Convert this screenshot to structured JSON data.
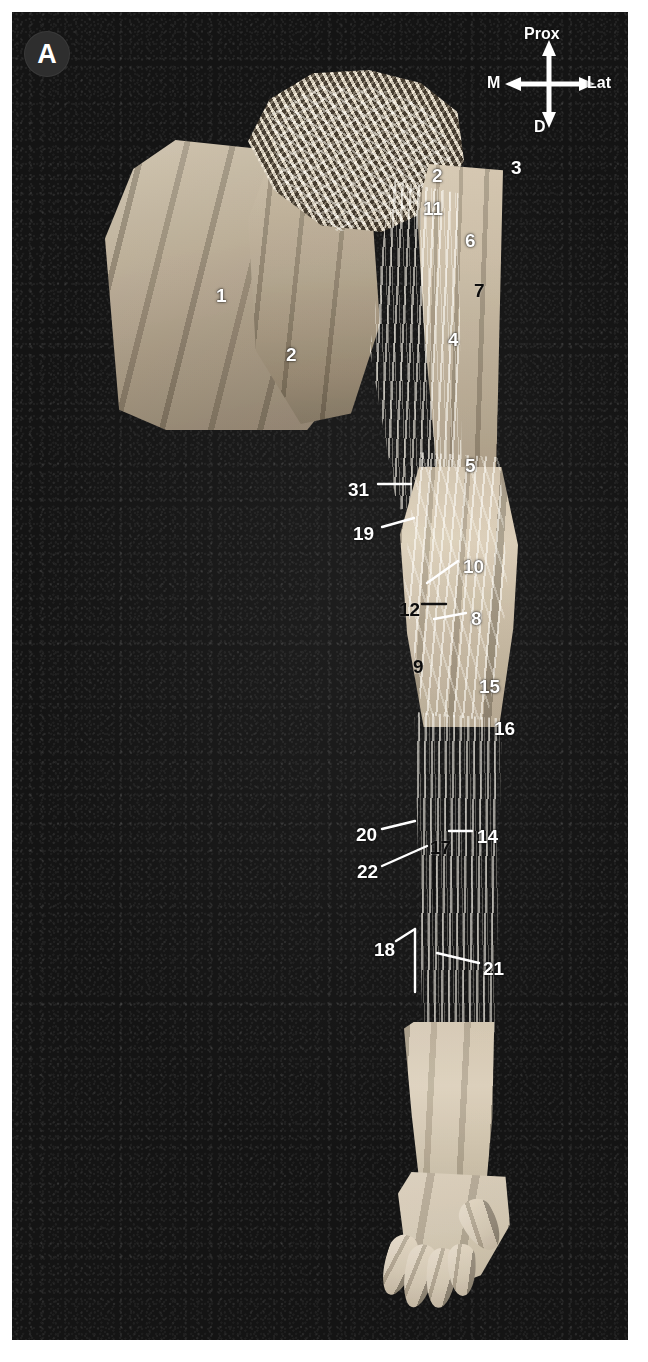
{
  "plate": {
    "panel_letter": "A",
    "background_color": "#141414",
    "label_light_color": "#ffffff",
    "label_dark_color": "#0c0c0c",
    "panel_badge_color": "#2e2e2e"
  },
  "compass": {
    "name": "orientation-compass",
    "proximal": "Prox",
    "medial": "M",
    "lateral": "Lat",
    "distal": "D"
  },
  "callouts": [
    {
      "id": "1",
      "text": "1",
      "x": 216,
      "y": 286,
      "color": "light",
      "region": "pectoralis-major"
    },
    {
      "id": "2a",
      "text": "2",
      "x": 286,
      "y": 345,
      "color": "light",
      "region": "deltoid-inferior"
    },
    {
      "id": "2b",
      "text": "2",
      "x": 432,
      "y": 166,
      "color": "light",
      "region": "deltoid-superior"
    },
    {
      "id": "3",
      "text": "3",
      "x": 511,
      "y": 158,
      "color": "light",
      "region": "lateral-shoulder"
    },
    {
      "id": "11",
      "text": "11",
      "x": 423,
      "y": 199,
      "color": "light",
      "region": "axillary-structure"
    },
    {
      "id": "6",
      "text": "6",
      "x": 465,
      "y": 231,
      "color": "light",
      "region": "upper-arm-medial"
    },
    {
      "id": "7",
      "text": "7",
      "x": 474,
      "y": 281,
      "color": "dark",
      "region": "upper-arm-lateral"
    },
    {
      "id": "4",
      "text": "4",
      "x": 448,
      "y": 330,
      "color": "light",
      "region": "mid-arm-nerve"
    },
    {
      "id": "5",
      "text": "5",
      "x": 465,
      "y": 456,
      "color": "light",
      "region": "distal-arm-muscle"
    },
    {
      "id": "31",
      "text": "31",
      "x": 348,
      "y": 480,
      "color": "light",
      "region": "medial-cutaneous-branch"
    },
    {
      "id": "19",
      "text": "19",
      "x": 353,
      "y": 524,
      "color": "light",
      "region": "medial-forearm-nerve"
    },
    {
      "id": "10",
      "text": "10",
      "x": 463,
      "y": 557,
      "color": "light",
      "region": "cubital-vessel"
    },
    {
      "id": "12",
      "text": "12",
      "x": 399,
      "y": 600,
      "color": "dark",
      "region": "cubital-fossa-medial"
    },
    {
      "id": "8",
      "text": "8",
      "x": 471,
      "y": 609,
      "color": "light",
      "region": "cubital-fossa-lateral"
    },
    {
      "id": "9",
      "text": "9",
      "x": 413,
      "y": 657,
      "color": "dark",
      "region": "forearm-flexor-mass"
    },
    {
      "id": "15",
      "text": "15",
      "x": 479,
      "y": 677,
      "color": "light",
      "region": "lateral-forearm-proximal"
    },
    {
      "id": "16",
      "text": "16",
      "x": 494,
      "y": 719,
      "color": "light",
      "region": "lateral-forearm"
    },
    {
      "id": "20",
      "text": "20",
      "x": 356,
      "y": 825,
      "color": "light",
      "region": "medial-forearm-branch"
    },
    {
      "id": "17",
      "text": "17",
      "x": 430,
      "y": 838,
      "color": "dark",
      "region": "mid-forearm-tendon"
    },
    {
      "id": "14",
      "text": "14",
      "x": 477,
      "y": 827,
      "color": "light",
      "region": "radial-side-structure"
    },
    {
      "id": "22",
      "text": "22",
      "x": 357,
      "y": 862,
      "color": "light",
      "region": "ulnar-side-branch"
    },
    {
      "id": "18",
      "text": "18",
      "x": 374,
      "y": 940,
      "color": "light",
      "region": "distal-ulnar-structure"
    },
    {
      "id": "21",
      "text": "21",
      "x": 483,
      "y": 959,
      "color": "light",
      "region": "distal-radial-structure"
    }
  ],
  "leaders": [
    {
      "id": "leader-31",
      "x1": 378,
      "y1": 484,
      "x2": 411,
      "y2": 484,
      "stroke": "#ffffff"
    },
    {
      "id": "leader-19",
      "x1": 382,
      "y1": 527,
      "x2": 414,
      "y2": 518,
      "stroke": "#ffffff"
    },
    {
      "id": "leader-10",
      "x1": 458,
      "y1": 561,
      "x2": 427,
      "y2": 583,
      "stroke": "#ffffff"
    },
    {
      "id": "leader-12",
      "x1": 422,
      "y1": 604,
      "x2": 446,
      "y2": 604,
      "stroke": "#111111"
    },
    {
      "id": "leader-8",
      "x1": 466,
      "y1": 613,
      "x2": 434,
      "y2": 619,
      "stroke": "#ffffff"
    },
    {
      "id": "leader-20",
      "x1": 382,
      "y1": 829,
      "x2": 415,
      "y2": 821,
      "stroke": "#ffffff"
    },
    {
      "id": "leader-22",
      "x1": 382,
      "y1": 866,
      "x2": 427,
      "y2": 846,
      "stroke": "#ffffff"
    },
    {
      "id": "leader-17",
      "x1": 434,
      "y1": 849,
      "x2": 434,
      "y2": 905,
      "stroke": "#111111"
    },
    {
      "id": "leader-14",
      "x1": 472,
      "y1": 831,
      "x2": 449,
      "y2": 831,
      "stroke": "#ffffff"
    },
    {
      "id": "leader-18",
      "x1": 396,
      "y1": 941,
      "x2": 415,
      "y2": 929,
      "stroke": "#ffffff"
    },
    {
      "id": "leader-18b",
      "x1": 415,
      "y1": 929,
      "x2": 415,
      "y2": 992,
      "stroke": "#ffffff"
    },
    {
      "id": "leader-21",
      "x1": 479,
      "y1": 963,
      "x2": 437,
      "y2": 953,
      "stroke": "#ffffff"
    }
  ]
}
